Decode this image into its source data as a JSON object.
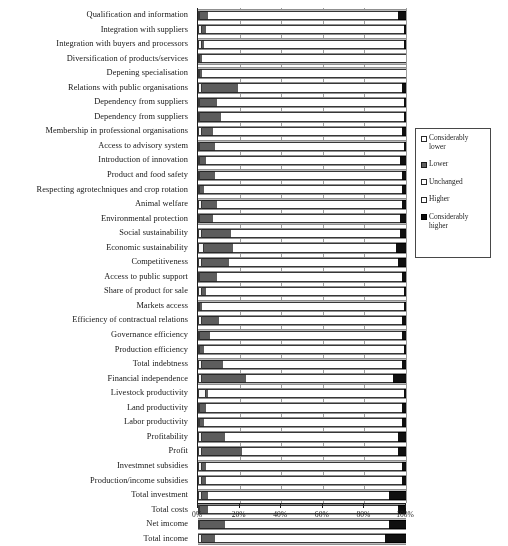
{
  "chart_data": {
    "type": "bar",
    "orientation": "horizontal",
    "stacked": true,
    "normalized_percent": true,
    "title": "",
    "xlabel": "",
    "ylabel": "",
    "xlim": [
      0,
      100
    ],
    "xticks": [
      0,
      20,
      40,
      60,
      80,
      100
    ],
    "xtick_labels": [
      "0%",
      "20%",
      "40%",
      "60%",
      "80%",
      "100%"
    ],
    "grid": true,
    "legend_position": "right",
    "legend_entries": [
      "Considerably lower",
      "Lower",
      "Unchanged",
      "Higher",
      "Considerably higher"
    ],
    "categories": [
      "Qualification and information",
      "Integration with suppliers",
      "Integration with buyers and processors",
      "Diversification of products/services",
      "Depening specialisation",
      "Relations with public organisations",
      "Dependency from suppliers",
      "Dependency from suppliers",
      "Membership in professional organisations",
      "Access to advisory system",
      "Introduction of innovation",
      "Product and food safety",
      "Respecting agrotechniques and crop rotation",
      "Animal welfare",
      "Environmental protection",
      "Social sustainability",
      "Economic sustainability",
      "Competitiveness",
      "Access to public support",
      "Share of product for sale",
      "Markets access",
      "Efficiency of contractual relations",
      "Governance efficiency",
      "Production efficiency",
      "Total indebtness",
      "Financial independence",
      "Livestock productivity",
      "Land productivity",
      "Labor productivity",
      "Profitability",
      "Profit",
      "Investmnet subsidies",
      "Production/income subsidies",
      "Total investment",
      "Total costs",
      "Net imcome",
      "Total income"
    ],
    "series": [
      {
        "name": "Considerably lower",
        "values": [
          1,
          2,
          2,
          1,
          1,
          2,
          1,
          1,
          2,
          1,
          1,
          1,
          1,
          2,
          1,
          2,
          3,
          2,
          1,
          2,
          1,
          2,
          1,
          1,
          2,
          2,
          4,
          1,
          1,
          2,
          2,
          2,
          2,
          2,
          1,
          1,
          2
        ]
      },
      {
        "name": "Lower",
        "values": [
          4,
          2,
          1,
          1,
          1,
          17,
          8,
          10,
          5,
          7,
          3,
          7,
          2,
          7,
          6,
          14,
          14,
          13,
          8,
          2,
          1,
          8,
          5,
          2,
          10,
          21,
          1,
          3,
          2,
          11,
          19,
          2,
          2,
          3,
          4,
          12,
          6
        ]
      },
      {
        "name": "Unchanged",
        "values": [
          36,
          52,
          58,
          99,
          99,
          47,
          72,
          64,
          43,
          55,
          38,
          54,
          57,
          46,
          36,
          42,
          45,
          45,
          37,
          32,
          25,
          52,
          39,
          36,
          76,
          48,
          46,
          35,
          32,
          37,
          52,
          76,
          74,
          36,
          38,
          35,
          33
        ]
      },
      {
        "name": "Higher",
        "values": [
          55,
          43,
          38,
          0,
          0,
          32,
          18,
          24,
          48,
          36,
          55,
          36,
          38,
          43,
          54,
          39,
          33,
          36,
          52,
          63,
          72,
          36,
          53,
          60,
          10,
          23,
          48,
          59,
          63,
          46,
          23,
          18,
          20,
          51,
          53,
          44,
          49
        ]
      },
      {
        "name": "Considerably higher",
        "values": [
          4,
          1,
          1,
          0,
          0,
          2,
          1,
          1,
          2,
          1,
          3,
          2,
          2,
          2,
          3,
          3,
          5,
          4,
          2,
          1,
          1,
          2,
          2,
          1,
          2,
          6,
          1,
          2,
          2,
          4,
          4,
          2,
          2,
          8,
          4,
          8,
          10
        ]
      }
    ]
  },
  "footnote": {
    "text": ""
  }
}
